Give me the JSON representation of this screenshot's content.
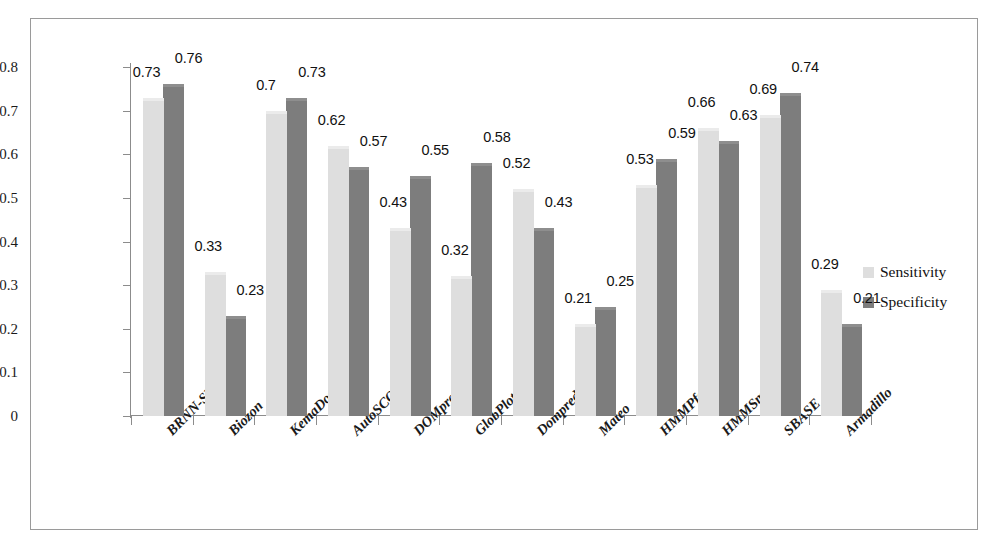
{
  "chart_data": {
    "type": "bar",
    "title": "",
    "xlabel": "",
    "ylabel": "",
    "ylim": [
      0,
      0.8
    ],
    "ytick_labels": [
      "0",
      "0.1",
      "0.2",
      "0.3",
      "0.4",
      "0.5",
      "0.6",
      "0.7",
      "0.8"
    ],
    "ytick_values": [
      0,
      0.1,
      0.2,
      0.3,
      0.4,
      0.5,
      0.6,
      0.7,
      0.8
    ],
    "grid": false,
    "legend_position": "right",
    "categories": [
      "BRNN-SVM",
      "Biozon",
      "KemaDom",
      "AutoSCOP",
      "DOMpro",
      "GlobPlot",
      "Dompred-DPS",
      "Mateo",
      "HMMPfam",
      "HMMSmart",
      "SBASE",
      "Armadillo"
    ],
    "series": [
      {
        "name": "Sensitivity",
        "color": "#dedede",
        "values": [
          0.73,
          0.33,
          0.7,
          0.62,
          0.43,
          0.32,
          0.52,
          0.21,
          0.53,
          0.66,
          0.69,
          0.29
        ],
        "labels": [
          "0.73",
          "0.33",
          "0.7",
          "0.62",
          "0.43",
          "0.32",
          "0.52",
          "0.21",
          "0.53",
          "0.66",
          "0.69",
          "0.29"
        ]
      },
      {
        "name": "Specificity",
        "color": "#7d7d7d",
        "values": [
          0.76,
          0.23,
          0.73,
          0.57,
          0.55,
          0.58,
          0.43,
          0.25,
          0.59,
          0.63,
          0.74,
          0.21
        ],
        "labels": [
          "0.76",
          "0.23",
          "0.73",
          "0.57",
          "0.55",
          "0.58",
          "0.43",
          "0.25",
          "0.59",
          "0.63",
          "0.74",
          "0.21"
        ]
      }
    ]
  },
  "legend": {
    "items": [
      {
        "label": "Sensitivity",
        "color": "#dedede"
      },
      {
        "label": "Specificity",
        "color": "#7d7d7d"
      }
    ]
  }
}
